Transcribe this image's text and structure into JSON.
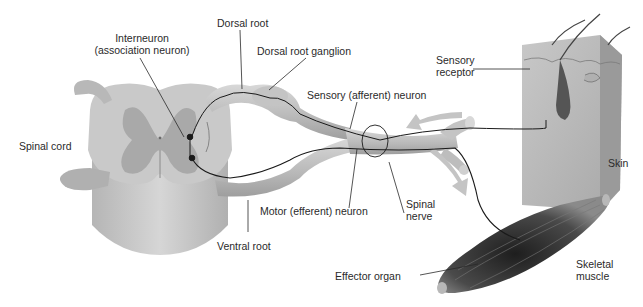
{
  "diagram": {
    "labels": {
      "dorsal_root": "Dorsal root",
      "interneuron_line1": "Interneuron",
      "interneuron_line2": "(association neuron)",
      "dorsal_root_ganglion": "Dorsal root ganglion",
      "sensory_receptor_line1": "Sensory",
      "sensory_receptor_line2": "receptor",
      "sensory_neuron": "Sensory (afferent) neuron",
      "spinal_cord": "Spinal cord",
      "skin": "Skin",
      "motor_neuron": "Motor (efferent) neuron",
      "spinal_nerve_line1": "Spinal",
      "spinal_nerve_line2": "nerve",
      "ventral_root": "Ventral root",
      "effector_organ": "Effector organ",
      "skeletal_muscle_line1": "Skeletal",
      "skeletal_muscle_line2": "muscle"
    },
    "colors": {
      "background": "#ffffff",
      "white_matter": "#c9c9c9",
      "gray_matter": "#a9a9a9",
      "nerve": "#bdbdbd",
      "skin_block": "#b8b8b8",
      "muscle": "#3a3a3a",
      "neuron_line": "#1a1a1a",
      "arrow": "#c4c4c4",
      "text": "#2a2a2a"
    }
  }
}
